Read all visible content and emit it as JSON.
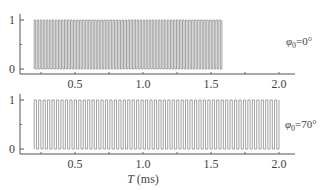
{
  "chart_data": [
    {
      "type": "line",
      "title": "",
      "panel_label": "φ0=0°",
      "panel_label_parts": {
        "symbol": "φ",
        "sub": "0",
        "value": "=0°"
      },
      "xlabel": "",
      "ylabel": "",
      "xlim": [
        0.0,
        2.1
      ],
      "ylim": [
        0,
        1
      ],
      "xticks": [
        0.5,
        1.0,
        1.5,
        2.0
      ],
      "xtick_labels": [
        "0.5",
        "1.0",
        "1.5",
        "2.0"
      ],
      "yticks": [
        0,
        1
      ],
      "ytick_labels": [
        "0",
        "1"
      ],
      "signal": "square pulse train",
      "pulse_start_ms": 0.2,
      "pulse_end_ms": 1.58,
      "pulse_count": 62,
      "low": 0,
      "high": 1,
      "grid": false
    },
    {
      "type": "line",
      "title": "",
      "panel_label": "φ0=70°",
      "panel_label_parts": {
        "symbol": "φ",
        "sub": "0",
        "value": "=70°"
      },
      "xlabel": "T (ms)",
      "xlabel_parts": {
        "var": "T",
        "unit": " (ms)"
      },
      "ylabel": "",
      "xlim": [
        0.0,
        2.1
      ],
      "ylim": [
        0,
        1
      ],
      "xticks": [
        0.5,
        1.0,
        1.5,
        2.0
      ],
      "xtick_labels": [
        "0.5",
        "1.0",
        "1.5",
        "2.0"
      ],
      "yticks": [
        0,
        1
      ],
      "ytick_labels": [
        "0",
        "1"
      ],
      "signal": "square pulse train",
      "pulse_start_ms": 0.2,
      "pulse_end_ms": 2.0,
      "pulse_count": 55,
      "low": 0,
      "high": 1,
      "grid": false
    }
  ],
  "colors": {
    "axis": "#555555",
    "trace": "#888888",
    "text": "#444444"
  }
}
